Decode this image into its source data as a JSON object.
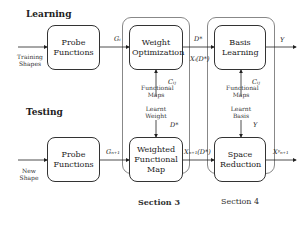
{
  "headings": {
    "learning": "Learning",
    "testing": "Testing"
  },
  "inputs": {
    "training": "Training Shapes",
    "new": "New Shape"
  },
  "boxes": {
    "probe_learn": "Probe Functions",
    "weight_opt": "Weight Optimization",
    "basis_learn": "Basis Learning",
    "probe_test": "Probe Functions",
    "weighted_fm": "Weighted Functional Map",
    "space_red": "Space Reduction"
  },
  "edge_labels": {
    "gi": "Gᵢ",
    "dstar_top": "D*",
    "xi_dstar": "Xᵢ(D*)",
    "y_top": "Y",
    "cij_left": "Cᵢⱼ",
    "cij_right": "Cᵢⱼ",
    "functional_maps_left": "Functional Maps",
    "functional_maps_right": "Functional Maps",
    "learnt_weight": "Learnt Weight",
    "learnt_basis": "Learnt Basis",
    "dstar_mid": "D*",
    "y_mid": "Y",
    "gn1": "Gₙ₊₁",
    "xn1_dstar": "Xₙ₊₁(D*)",
    "xn1_y": "Xʸₙ₊₁"
  },
  "sections": {
    "s3": "Section 3",
    "s4": "Section 4"
  }
}
